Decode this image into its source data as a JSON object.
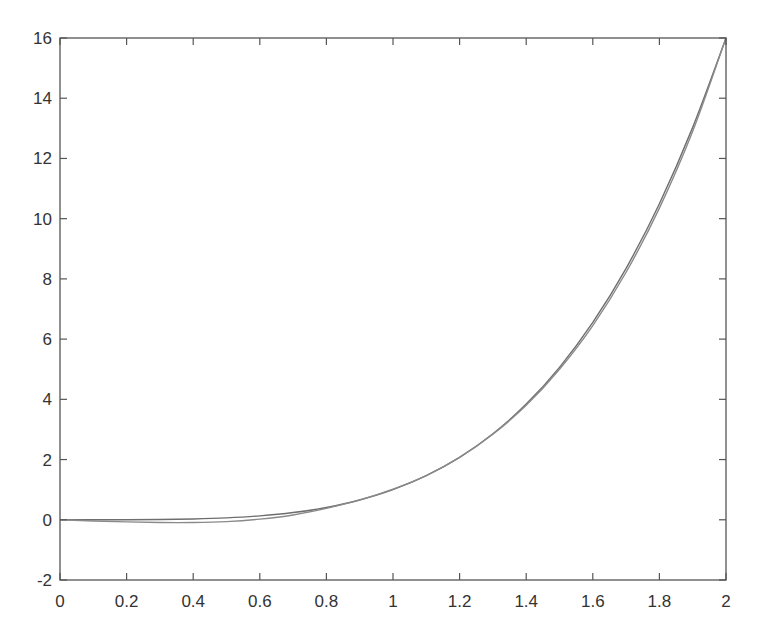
{
  "chart_data": {
    "type": "line",
    "title": "",
    "xlabel": "",
    "ylabel": "",
    "xlim": [
      0,
      2
    ],
    "ylim": [
      -2,
      16
    ],
    "grid": false,
    "legend": null,
    "x_ticks": [
      "0",
      "0.2",
      "0.4",
      "0.6",
      "0.8",
      "1",
      "1.2",
      "1.4",
      "1.6",
      "1.8",
      "2"
    ],
    "y_ticks": [
      "-2",
      "0",
      "2",
      "4",
      "6",
      "8",
      "10",
      "12",
      "14",
      "16"
    ],
    "x": [
      0,
      0.1,
      0.2,
      0.3,
      0.4,
      0.5,
      0.6,
      0.7,
      0.8,
      0.9,
      1.0,
      1.1,
      1.2,
      1.3,
      1.4,
      1.5,
      1.6,
      1.7,
      1.8,
      1.9,
      2.0
    ],
    "series": [
      {
        "name": "curve-1",
        "color": "#6e6e6e",
        "values": [
          0,
          0.0001,
          0.0016,
          0.0081,
          0.0256,
          0.0625,
          0.1296,
          0.2401,
          0.4096,
          0.6561,
          1.0,
          1.4641,
          2.0736,
          2.8561,
          3.8416,
          5.0625,
          6.5536,
          8.3521,
          10.4976,
          13.0321,
          16.0
        ]
      },
      {
        "name": "curve-2",
        "color": "#8a8a8a",
        "values": [
          0,
          -0.04,
          -0.07,
          -0.09,
          -0.09,
          -0.06,
          0.02,
          0.16,
          0.38,
          0.66,
          1.02,
          1.47,
          2.07,
          2.84,
          3.8,
          5.0,
          6.45,
          8.22,
          10.35,
          12.9,
          16.0
        ]
      }
    ]
  },
  "axes": {
    "frame_color": "#555555",
    "background": "#ffffff"
  }
}
